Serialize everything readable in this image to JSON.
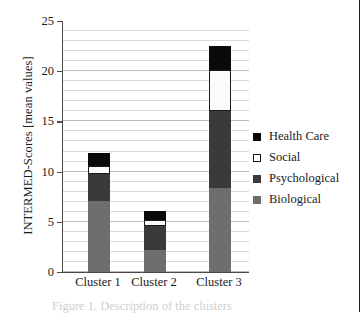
{
  "chart_data": {
    "type": "bar",
    "subtype": "stacked-vertical",
    "title": "",
    "xlabel": "",
    "ylabel": "INTERMED-Scores [mean values]",
    "categories": [
      "Cluster 1",
      "Cluster 2",
      "Cluster 3"
    ],
    "series": [
      {
        "name": "Biological",
        "color": "#6e6e6e",
        "values": [
          7.1,
          2.2,
          8.4
        ]
      },
      {
        "name": "Psychological",
        "color": "#3a3a3a",
        "values": [
          2.7,
          2.4,
          7.6
        ]
      },
      {
        "name": "Social",
        "color": "#ffffff",
        "values": [
          0.8,
          0.6,
          4.1
        ]
      },
      {
        "name": "Health Care",
        "color": "#0a0a0a",
        "values": [
          1.3,
          0.9,
          2.4
        ]
      }
    ],
    "stack_totals": [
      11.9,
      6.1,
      22.5
    ],
    "ylim": [
      0,
      25
    ],
    "ytick_step": 5,
    "yticks": [
      "0",
      "5",
      "10",
      "15",
      "20",
      "25"
    ],
    "minor_gridline_step": 1,
    "grid": true,
    "legend_position": "right",
    "legend": [
      {
        "label": "Health Care",
        "swatch": "health"
      },
      {
        "label": "Social",
        "swatch": "social"
      },
      {
        "label": "Psychological",
        "swatch": "psych"
      },
      {
        "label": "Biological",
        "swatch": "bio"
      }
    ]
  },
  "caption": "Figure 1. Description of the clusters"
}
